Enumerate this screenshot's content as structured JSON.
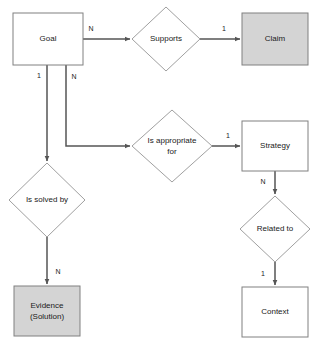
{
  "diagram": {
    "type": "entity-relationship-diagram",
    "width": 318,
    "height": 347,
    "background_color": "#ffffff",
    "colors": {
      "shaded_entity_fill": "#d4d4d4",
      "plain_entity_fill": "#ffffff",
      "entity_stroke": "#808080",
      "diamond_stroke": "#a0a0a0",
      "edge_stroke": "#555555",
      "text": "#1a1a1a"
    },
    "entities": [
      {
        "id": "goal",
        "label": "Goal",
        "shape": "rectangle",
        "shaded": false,
        "x": 13,
        "y": 13,
        "w": 70,
        "h": 52,
        "cx": 48,
        "cy": 39
      },
      {
        "id": "claim",
        "label": "Claim",
        "shape": "rectangle",
        "shaded": true,
        "x": 242,
        "y": 13,
        "w": 66,
        "h": 52,
        "cx": 275,
        "cy": 39
      },
      {
        "id": "strategy",
        "label": "Strategy",
        "shape": "rectangle",
        "shaded": false,
        "x": 242,
        "y": 121,
        "w": 66,
        "h": 50,
        "cx": 275,
        "cy": 146
      },
      {
        "id": "evidence",
        "label": "Evidence",
        "label_line2": "(Solution)",
        "shape": "rectangle",
        "shaded": true,
        "x": 14,
        "y": 286,
        "w": 66,
        "h": 50,
        "cx": 47,
        "cy": 311
      },
      {
        "id": "context",
        "label": "Context",
        "shape": "rectangle",
        "shaded": false,
        "x": 242,
        "y": 287,
        "w": 66,
        "h": 50,
        "cx": 275,
        "cy": 312
      }
    ],
    "relationships": [
      {
        "id": "supports",
        "label": "Supports",
        "shape": "diamond",
        "cx": 166,
        "cy": 39,
        "rx": 34,
        "ry": 32
      },
      {
        "id": "is-appropriate-for",
        "label": "Is appropriate",
        "label_line2": "for",
        "shape": "diamond",
        "cx": 172,
        "cy": 146,
        "rx": 40,
        "ry": 36
      },
      {
        "id": "is-solved-by",
        "label": "Is solved by",
        "shape": "diamond",
        "cx": 47,
        "cy": 200,
        "rx": 38,
        "ry": 37
      },
      {
        "id": "related-to",
        "label": "Related to",
        "shape": "diamond",
        "cx": 275,
        "cy": 229,
        "rx": 35,
        "ry": 33
      }
    ],
    "edges": [
      {
        "id": "goal-to-supports",
        "from": "goal",
        "to": "supports",
        "cardinality": "N",
        "label_x": 91,
        "label_y": 29,
        "path": "M 83 39 L 130 39",
        "arrow_at": "end",
        "arrow_x": 130,
        "arrow_y": 39,
        "arrow_dir": "right"
      },
      {
        "id": "supports-to-claim",
        "from": "supports",
        "to": "claim",
        "cardinality": "1",
        "label_x": 224,
        "label_y": 29,
        "path": "M 200 39 L 240 39",
        "arrow_at": "end",
        "arrow_x": 240,
        "arrow_y": 39,
        "arrow_dir": "right"
      },
      {
        "id": "goal-to-is-solved-by",
        "from": "goal",
        "to": "is-solved-by",
        "cardinality": "1",
        "label_x": 39,
        "label_y": 76,
        "path": "M 47 65 L 47 161",
        "arrow_at": "end",
        "arrow_x": 47,
        "arrow_y": 161,
        "arrow_dir": "down"
      },
      {
        "id": "goal-to-is-appropriate-for",
        "from": "goal",
        "to": "is-appropriate-for",
        "cardinality": "N",
        "label_x": 74,
        "label_y": 77,
        "path": "M 66 65 L 66 146 L 130 146",
        "arrow_at": "end",
        "arrow_x": 130,
        "arrow_y": 146,
        "arrow_dir": "right"
      },
      {
        "id": "is-appropriate-for-to-strategy",
        "from": "is-appropriate-for",
        "to": "strategy",
        "cardinality": "1",
        "label_x": 228,
        "label_y": 136,
        "path": "M 212 146 L 240 146",
        "arrow_at": "end",
        "arrow_x": 240,
        "arrow_y": 146,
        "arrow_dir": "right"
      },
      {
        "id": "strategy-to-related-to",
        "from": "strategy",
        "to": "related-to",
        "cardinality": "N",
        "label_x": 263,
        "label_y": 182,
        "path": "M 275 171 L 275 194",
        "arrow_at": "end",
        "arrow_x": 275,
        "arrow_y": 194,
        "arrow_dir": "down"
      },
      {
        "id": "related-to-to-context",
        "from": "related-to",
        "to": "context",
        "cardinality": "1",
        "label_x": 263,
        "label_y": 274,
        "path": "M 275 262 L 275 285",
        "arrow_at": "end",
        "arrow_x": 275,
        "arrow_y": 285,
        "arrow_dir": "down"
      },
      {
        "id": "is-solved-by-to-evidence",
        "from": "is-solved-by",
        "to": "evidence",
        "cardinality": "N",
        "label_x": 58,
        "label_y": 272,
        "path": "M 47 237 L 47 284",
        "arrow_at": "end",
        "arrow_x": 47,
        "arrow_y": 284,
        "arrow_dir": "down"
      }
    ]
  }
}
